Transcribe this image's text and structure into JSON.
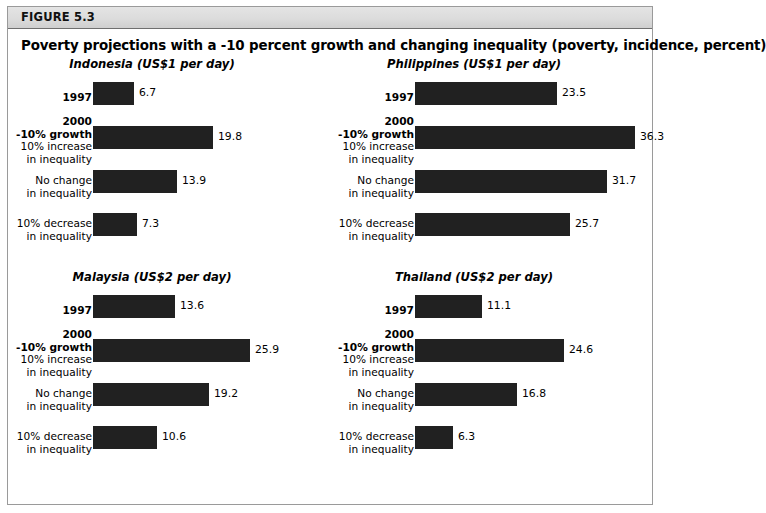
{
  "figure": {
    "number": "FIGURE 5.3",
    "title": "Poverty projections with a -10 percent growth and changing inequality (poverty, incidence, percent)"
  },
  "row_labels": [
    {
      "strong": "1997",
      "normal": ""
    },
    {
      "strong_1": "2000",
      "strong_2": "-10% growth",
      "normal_1": "10% increase",
      "normal_2": "in inequality"
    },
    {
      "normal_1": "No change",
      "normal_2": "in inequality"
    },
    {
      "normal_1": "10% decrease",
      "normal_2": "in inequality"
    }
  ],
  "chart_data": {
    "type": "bar",
    "title": "Poverty projections with a -10 percent growth and changing inequality (poverty, incidence, percent)",
    "xlabel": "",
    "ylabel": "",
    "orientation": "horizontal",
    "grid": false,
    "legend": "none",
    "value_labels": true,
    "xlim": [
      0,
      36.3
    ],
    "categories": [
      "1997",
      "2000 -10% growth, 10% increase in inequality",
      "2000 -10% growth, No change in inequality",
      "2000 -10% growth, 10% decrease in inequality"
    ],
    "panels": [
      {
        "title": "Indonesia (US$1 per day)",
        "country": "Indonesia",
        "poverty_line": "US$1 per day",
        "values": [
          6.7,
          19.8,
          13.9,
          7.3
        ]
      },
      {
        "title": "Philippines (US$1 per day)",
        "country": "Philippines",
        "poverty_line": "US$1 per day",
        "values": [
          23.5,
          36.3,
          31.7,
          25.7
        ]
      },
      {
        "title": "Malaysia (US$2 per day)",
        "country": "Malaysia",
        "poverty_line": "US$2 per day",
        "values": [
          13.6,
          25.9,
          19.2,
          10.6
        ]
      },
      {
        "title": "Thailand (US$2 per day)",
        "country": "Thailand",
        "poverty_line": "US$2 per day",
        "values": [
          11.1,
          24.6,
          16.8,
          6.3
        ]
      }
    ],
    "colors": {
      "bar": "#212121",
      "background": "#ffffff",
      "header_band": "#dcdcdc",
      "frame_border": "#9a9a9a"
    }
  }
}
